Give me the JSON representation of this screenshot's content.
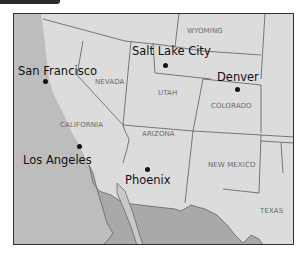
{
  "colors": {
    "land": "#dcdcdc",
    "ocean": "#bdbdbd",
    "mexico": "#a9a9a9",
    "border": "#4a4a4a",
    "frame": "#333333"
  },
  "states": [
    {
      "name": "WYOMING"
    },
    {
      "name": "NEVADA"
    },
    {
      "name": "UTAH"
    },
    {
      "name": "COLORADO"
    },
    {
      "name": "CALIFORNIA"
    },
    {
      "name": "ARIZONA"
    },
    {
      "name": "NEW MEXICO"
    },
    {
      "name": "TEXAS"
    }
  ],
  "cities": [
    {
      "name": "San Francisco"
    },
    {
      "name": "Salt Lake City"
    },
    {
      "name": "Denver"
    },
    {
      "name": "Los Angeles"
    },
    {
      "name": "Phoenix"
    }
  ]
}
